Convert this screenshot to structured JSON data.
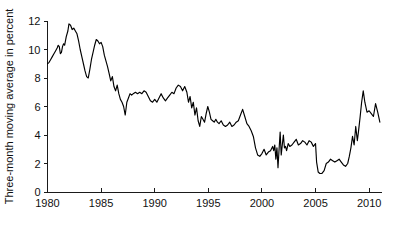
{
  "chart_data": {
    "type": "line",
    "title": "",
    "subtitle": "",
    "xlabel": "",
    "ylabel": "Three-month moving average in percent",
    "xlim": [
      1980,
      2011.2
    ],
    "ylim": [
      0,
      12
    ],
    "grid": false,
    "legend": null,
    "legend_position": "none",
    "xticks": [
      1980,
      1985,
      1990,
      1995,
      2000,
      2005,
      2010
    ],
    "xtick_labels": [
      "1980",
      "1985",
      "1990",
      "1995",
      "2000",
      "2005",
      "2010"
    ],
    "yticks": [
      0,
      2,
      4,
      6,
      8,
      10,
      12
    ],
    "ytick_labels": [
      "0",
      "2",
      "4",
      "6",
      "8",
      "10",
      "12"
    ],
    "line_color": "#000000",
    "series": [
      {
        "name": "Three-month moving average",
        "x": [
          1980.0,
          1980.15,
          1980.3,
          1980.45,
          1980.6,
          1980.75,
          1980.9,
          1981.0,
          1981.1,
          1981.2,
          1981.3,
          1981.4,
          1981.5,
          1981.6,
          1981.75,
          1981.9,
          1982.0,
          1982.15,
          1982.3,
          1982.45,
          1982.6,
          1982.75,
          1982.9,
          1983.05,
          1983.2,
          1983.35,
          1983.5,
          1983.65,
          1983.8,
          1983.95,
          1984.1,
          1984.25,
          1984.4,
          1984.55,
          1984.7,
          1984.85,
          1985.0,
          1985.15,
          1985.3,
          1985.45,
          1985.6,
          1985.75,
          1985.9,
          1986.05,
          1986.2,
          1986.35,
          1986.5,
          1986.65,
          1986.8,
          1986.95,
          1987.1,
          1987.25,
          1987.4,
          1987.55,
          1987.7,
          1987.85,
          1988.0,
          1988.2,
          1988.4,
          1988.6,
          1988.8,
          1989.0,
          1989.2,
          1989.4,
          1989.6,
          1989.8,
          1990.0,
          1990.2,
          1990.4,
          1990.6,
          1990.8,
          1991.0,
          1991.2,
          1991.4,
          1991.6,
          1991.8,
          1992.0,
          1992.2,
          1992.4,
          1992.6,
          1992.8,
          1993.0,
          1993.15,
          1993.3,
          1993.45,
          1993.6,
          1993.75,
          1993.9,
          1994.05,
          1994.2,
          1994.35,
          1994.5,
          1994.65,
          1994.8,
          1994.95,
          1995.1,
          1995.25,
          1995.4,
          1995.55,
          1995.7,
          1995.85,
          1996.0,
          1996.2,
          1996.4,
          1996.6,
          1996.8,
          1997.0,
          1997.2,
          1997.4,
          1997.6,
          1997.8,
          1998.0,
          1998.2,
          1998.4,
          1998.6,
          1998.8,
          1999.0,
          1999.2,
          1999.4,
          1999.6,
          1999.8,
          2000.0,
          2000.2,
          2000.4,
          2000.6,
          2000.8,
          2001.0,
          2001.1,
          2001.2,
          2001.3,
          2001.4,
          2001.5,
          2001.6,
          2001.7,
          2001.8,
          2001.9,
          2002.0,
          2002.1,
          2002.2,
          2002.3,
          2002.45,
          2002.6,
          2002.8,
          2003.0,
          2003.2,
          2003.4,
          2003.6,
          2003.8,
          2004.0,
          2004.2,
          2004.4,
          2004.6,
          2004.8,
          2005.0,
          2005.1,
          2005.25,
          2005.4,
          2005.6,
          2005.8,
          2006.0,
          2006.2,
          2006.4,
          2006.6,
          2006.8,
          2007.0,
          2007.2,
          2007.4,
          2007.6,
          2007.8,
          2008.0,
          2008.15,
          2008.3,
          2008.45,
          2008.6,
          2008.75,
          2008.9,
          2009.0,
          2009.15,
          2009.3,
          2009.45,
          2009.6,
          2009.8,
          2010.0,
          2010.2,
          2010.4,
          2010.6,
          2010.8,
          2011.0
        ],
        "values": [
          9.0,
          9.1,
          9.3,
          9.5,
          9.7,
          9.9,
          10.1,
          10.3,
          10.2,
          9.7,
          9.8,
          10.2,
          10.4,
          10.3,
          10.9,
          11.3,
          11.8,
          11.7,
          11.4,
          11.5,
          11.3,
          11.1,
          10.6,
          10.0,
          9.5,
          9.0,
          8.5,
          8.1,
          8.0,
          8.6,
          9.3,
          9.8,
          10.3,
          10.7,
          10.6,
          10.4,
          10.5,
          10.2,
          9.6,
          9.2,
          8.8,
          8.3,
          7.8,
          8.1,
          7.4,
          7.1,
          7.5,
          6.9,
          6.5,
          6.3,
          6.0,
          5.4,
          6.3,
          6.6,
          6.9,
          6.8,
          6.9,
          7.0,
          6.9,
          7.0,
          6.9,
          7.1,
          7.0,
          6.7,
          6.4,
          6.3,
          6.5,
          6.3,
          6.6,
          6.9,
          6.6,
          6.4,
          6.6,
          6.8,
          7.0,
          6.9,
          7.3,
          7.5,
          7.4,
          7.1,
          7.4,
          7.0,
          6.3,
          6.7,
          5.9,
          6.3,
          5.4,
          5.9,
          5.0,
          4.6,
          5.3,
          5.1,
          4.9,
          5.5,
          6.0,
          5.6,
          5.1,
          5.0,
          4.9,
          5.1,
          4.9,
          4.8,
          5.0,
          4.7,
          4.6,
          4.7,
          4.9,
          4.6,
          4.7,
          4.9,
          5.0,
          5.4,
          5.8,
          5.3,
          4.8,
          4.6,
          4.3,
          3.9,
          3.1,
          2.6,
          2.5,
          2.7,
          3.0,
          2.6,
          2.8,
          2.9,
          3.2,
          2.9,
          3.3,
          2.3,
          3.1,
          1.7,
          3.0,
          4.2,
          2.6,
          3.3,
          4.0,
          3.1,
          3.2,
          2.9,
          3.4,
          3.2,
          3.3,
          3.5,
          3.7,
          3.3,
          3.4,
          3.6,
          3.5,
          3.3,
          3.6,
          3.5,
          3.2,
          3.4,
          2.1,
          1.4,
          1.3,
          1.3,
          1.5,
          2.0,
          2.1,
          2.3,
          2.2,
          2.1,
          2.2,
          2.3,
          2.1,
          1.9,
          1.8,
          2.0,
          2.5,
          3.1,
          3.9,
          3.3,
          4.6,
          3.6,
          4.2,
          5.2,
          6.3,
          7.1,
          6.3,
          5.6,
          5.7,
          5.5,
          5.3,
          6.2,
          5.6,
          4.9
        ]
      }
    ]
  },
  "axis_label": {
    "y": "Three-month moving average in percent"
  }
}
